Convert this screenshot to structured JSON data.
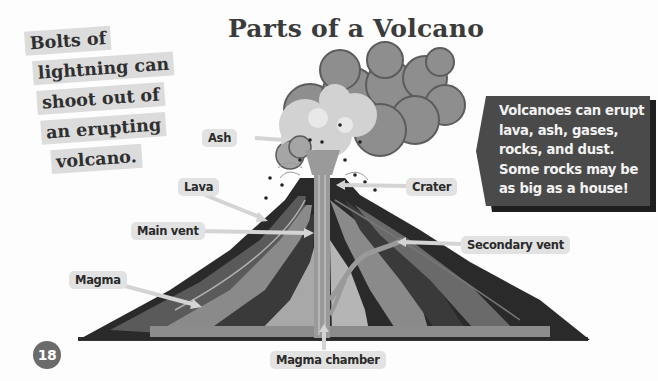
{
  "page": {
    "title": "Parts of a Volcano",
    "page_number": "18"
  },
  "fact_box": {
    "lines": [
      "Bolts of",
      "lightning can",
      "shoot out of",
      "an erupting",
      "volcano."
    ]
  },
  "callout": {
    "lines": [
      "Volcanoes can erupt",
      "lava, ash, gases,",
      "rocks, and dust.",
      "Some rocks may be",
      "as big as a house!"
    ]
  },
  "diagram": {
    "labels": {
      "ash": "Ash",
      "lava": "Lava",
      "crater": "Crater",
      "main_vent": "Main vent",
      "secondary_vent": "Secondary vent",
      "magma": "Magma",
      "magma_chamber": "Magma chamber"
    }
  },
  "colors": {
    "title": "#3b3b3b",
    "callout_bg": "#4a4a4a",
    "label_bg": "#e2e2e2",
    "page_badge": "#6b6b6b"
  }
}
